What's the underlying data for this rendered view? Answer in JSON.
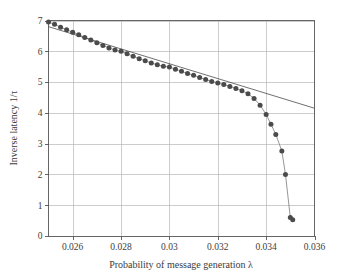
{
  "chart_data": {
    "type": "scatter",
    "title": "",
    "xlabel": "Probability of message generation λ",
    "ylabel": "Inverse latency 1/τ",
    "xlim": [
      0.025,
      0.036
    ],
    "ylim": [
      0,
      7
    ],
    "grid": true,
    "legend": null,
    "xticks": [
      0.026,
      0.028,
      0.03,
      0.032,
      0.034,
      0.036
    ],
    "xtick_labels": [
      "0.026",
      "0.028",
      "0.03",
      "0.032",
      "0.034",
      "0.036"
    ],
    "yticks": [
      0,
      1,
      2,
      3,
      4,
      5,
      6,
      7
    ],
    "ytick_labels": [
      "0",
      "1",
      "2",
      "3",
      "4",
      "5",
      "6",
      "7"
    ],
    "series": [
      {
        "name": "simulation",
        "style": "markers",
        "marker": "filled-circle",
        "color": "#4b4b4b",
        "x": [
          0.025,
          0.02525,
          0.0255,
          0.02575,
          0.026,
          0.02625,
          0.0265,
          0.02675,
          0.027,
          0.02725,
          0.0275,
          0.02775,
          0.028,
          0.02825,
          0.0285,
          0.02875,
          0.029,
          0.02925,
          0.0295,
          0.02975,
          0.03,
          0.03025,
          0.0305,
          0.03075,
          0.031,
          0.03125,
          0.0315,
          0.03175,
          0.032,
          0.03225,
          0.0325,
          0.03275,
          0.033,
          0.03325,
          0.0335,
          0.03375,
          0.034,
          0.0342,
          0.0344,
          0.03465,
          0.0348,
          0.035,
          0.0351
        ],
        "y": [
          6.95,
          6.88,
          6.78,
          6.7,
          6.62,
          6.54,
          6.45,
          6.37,
          6.28,
          6.19,
          6.11,
          6.04,
          6.0,
          5.92,
          5.84,
          5.76,
          5.69,
          5.62,
          5.56,
          5.51,
          5.49,
          5.42,
          5.35,
          5.28,
          5.22,
          5.15,
          5.08,
          5.02,
          4.97,
          4.92,
          4.86,
          4.79,
          4.72,
          4.62,
          4.47,
          4.25,
          3.95,
          3.63,
          3.3,
          2.76,
          2.0,
          0.6,
          0.53
        ]
      },
      {
        "name": "theory",
        "style": "line",
        "color": "#4a4a4a",
        "x": [
          0.025,
          0.036
        ],
        "y": [
          6.8,
          4.15
        ]
      }
    ]
  },
  "axes": {
    "x_title": "Probability of message generation λ",
    "y_title": "Inverse latency 1/τ"
  },
  "colors": {
    "marker": "#4b4b4b",
    "fitline": "#4a4a4a",
    "gridline": "#b6b6b6",
    "frame": "#555555",
    "background": "#ffffff"
  }
}
